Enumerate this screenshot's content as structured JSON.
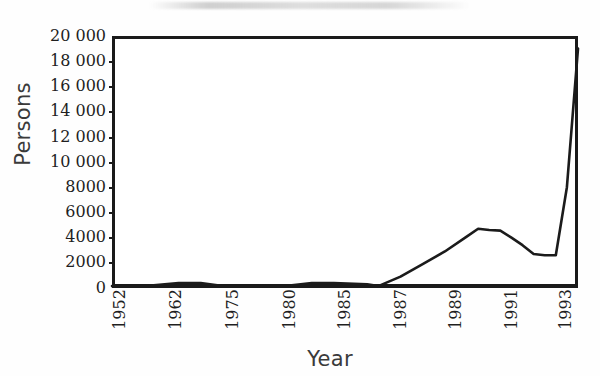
{
  "figure": {
    "background_color": "#fefefe",
    "line_color": "#1b1b1b",
    "axis_color": "#1a1a1a"
  },
  "axes": {
    "y_title": "Persons",
    "x_title": "Year",
    "y_ticks": [
      "20 000",
      "18 000",
      "16 000",
      "14 000",
      "12 000",
      "10 000",
      "8000",
      "6000",
      "4000",
      "2000",
      "0"
    ],
    "x_ticks": [
      "1952",
      "1962",
      "1975",
      "1980",
      "1985",
      "1987",
      "1989",
      "1991",
      "1993"
    ]
  },
  "chart_data": {
    "type": "line",
    "title": "",
    "subtitle": "",
    "xlabel": "Year",
    "ylabel": "Persons",
    "ylim": [
      0,
      20000
    ],
    "ytick_values": [
      0,
      2000,
      4000,
      6000,
      8000,
      10000,
      12000,
      14000,
      16000,
      18000,
      20000
    ],
    "ytick_labels": [
      "0",
      "2000",
      "4000",
      "6000",
      "8000",
      "10 000",
      "12 000",
      "14 000",
      "16 000",
      "18 000",
      "20 000"
    ],
    "xtick_labels": [
      "1952",
      "1962",
      "1975",
      "1980",
      "1985",
      "1987",
      "1989",
      "1991",
      "1993"
    ],
    "x_axis_type": "categorical-uneven-year-labels",
    "grid": false,
    "legend": false,
    "series": [
      {
        "name": "Persons",
        "categories": [
          "1952",
          "1962",
          "1975",
          "1980",
          "1985",
          "1987",
          "1989",
          "1991",
          "1993"
        ],
        "x": [
          1952,
          1955,
          1958,
          1960,
          1962,
          1965,
          1968,
          1970,
          1972,
          1975,
          1976,
          1978,
          1980,
          1982,
          1984,
          1985,
          1986,
          1987,
          1988,
          1989,
          1990,
          1991,
          1992,
          1993,
          1994
        ],
        "values": [
          150,
          150,
          400,
          400,
          150,
          150,
          200,
          400,
          400,
          300,
          150,
          900,
          1900,
          2900,
          4100,
          4700,
          4600,
          4550,
          4000,
          3400,
          2700,
          2600,
          2600,
          8000,
          19000
        ]
      }
    ],
    "annotations": [
      {
        "text": "plateau peak near 4700 persons around 1985-1987"
      },
      {
        "text": "trough near 2600 persons around 1990-1991"
      },
      {
        "text": "steep rise to about 19 000 persons by 1994"
      }
    ]
  }
}
